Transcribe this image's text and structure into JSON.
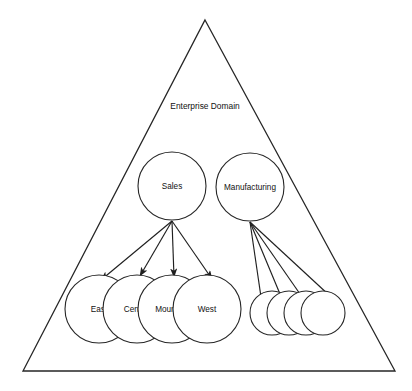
{
  "figure": {
    "background_color": "#ffffff",
    "stroke_color": "#262626",
    "text_color": "#111111",
    "caption": ""
  },
  "container": {
    "name": "enterprise-domain-triangle",
    "label": "Enterprise Domain",
    "shape": "triangle",
    "label_x": 205,
    "label_y": 107,
    "apex_x": 205,
    "apex_y": 20,
    "left_x": 23,
    "left_y": 371,
    "right_x": 395,
    "right_y": 371
  },
  "parent_nodes": [
    {
      "id": "sales",
      "label": "Sales",
      "cx": 172,
      "cy": 186,
      "r": 34
    },
    {
      "id": "manufacturing",
      "label": "Manufacturing",
      "cx": 250,
      "cy": 187,
      "r": 34
    }
  ],
  "sales_children": [
    {
      "id": "east",
      "label": "East",
      "cx": 99,
      "cy": 309,
      "r": 34
    },
    {
      "id": "central",
      "label": "Central",
      "cx": 137,
      "cy": 309,
      "r": 34
    },
    {
      "id": "mountain",
      "label": "Mountain",
      "cx": 172,
      "cy": 309,
      "r": 34
    },
    {
      "id": "west",
      "label": "West",
      "cx": 207,
      "cy": 309,
      "r": 34
    }
  ],
  "manufacturing_children": [
    {
      "id": "mfg-child-1",
      "label": "",
      "cx": 272,
      "cy": 313,
      "r": 22
    },
    {
      "id": "mfg-child-2",
      "label": "",
      "cx": 289,
      "cy": 313,
      "r": 22
    },
    {
      "id": "mfg-child-3",
      "label": "",
      "cx": 306,
      "cy": 313,
      "r": 22
    },
    {
      "id": "mfg-child-4",
      "label": "",
      "cx": 323,
      "cy": 313,
      "r": 22
    }
  ],
  "sales_connectors": [
    {
      "id": "sales-to-east",
      "x1": 172,
      "y1": 221,
      "x2": 101,
      "y2": 280,
      "arrowhead": true
    },
    {
      "id": "sales-to-central",
      "x1": 172,
      "y1": 221,
      "x2": 140,
      "y2": 276,
      "arrowhead": true
    },
    {
      "id": "sales-to-mountain",
      "x1": 172,
      "y1": 221,
      "x2": 174,
      "y2": 277,
      "arrowhead": true
    },
    {
      "id": "sales-to-west",
      "x1": 172,
      "y1": 221,
      "x2": 212,
      "y2": 279,
      "arrowhead": true
    }
  ],
  "manufacturing_connectors": [
    {
      "id": "mfg-to-child-1",
      "x1": 250,
      "y1": 222,
      "x2": 261,
      "y2": 297,
      "arrowhead": false
    },
    {
      "id": "mfg-to-child-2",
      "x1": 250,
      "y1": 222,
      "x2": 280,
      "y2": 294,
      "arrowhead": false
    },
    {
      "id": "mfg-to-child-3",
      "x1": 250,
      "y1": 222,
      "x2": 300,
      "y2": 294,
      "arrowhead": false
    },
    {
      "id": "mfg-to-child-4",
      "x1": 250,
      "y1": 222,
      "x2": 330,
      "y2": 296,
      "arrowhead": false
    }
  ]
}
